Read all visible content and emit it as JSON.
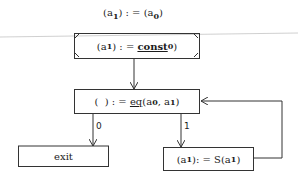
{
  "diagram": {
    "header": {
      "text_pre": "(a",
      "sub1": "1",
      "text_mid": ") : = (a",
      "sub2": "0",
      "text_post": ")"
    },
    "init_box": {
      "pre": "(a",
      "sub1": "1",
      "mid": ") : = ",
      "fn": "const",
      "sub2": "0",
      "post": ")"
    },
    "test_box": {
      "pre": "(  ) : = ",
      "fn": "eq",
      "args_pre": "(a",
      "sub1": "0",
      "comma": ", a",
      "sub2": "1",
      "post": ")"
    },
    "branch_false_label": "0",
    "branch_true_label": "1",
    "exit_box": {
      "label": "exit"
    },
    "succ_box": {
      "pre": "(a",
      "sub1": "1",
      "mid": "): = S(a",
      "sub2": "1",
      "post": ")"
    },
    "colors": {
      "line": "#333333",
      "text": "#1c1c1c",
      "background": "#ffffff"
    }
  }
}
